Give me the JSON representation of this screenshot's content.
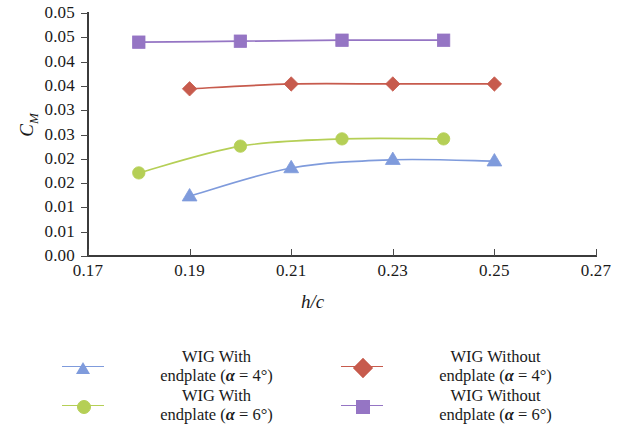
{
  "chart_data": {
    "type": "line",
    "title": "",
    "xlabel": "h/c",
    "ylabel": "C_M",
    "xlim": [
      0.17,
      0.27
    ],
    "ylim": [
      0.0,
      0.05
    ],
    "grid": false,
    "legend_position": "below",
    "x_ticks": [
      {
        "value": 0.17,
        "label": "0.17"
      },
      {
        "value": 0.19,
        "label": "0.19"
      },
      {
        "value": 0.21,
        "label": "0.21"
      },
      {
        "value": 0.23,
        "label": "0.23"
      },
      {
        "value": 0.25,
        "label": "0.25"
      },
      {
        "value": 0.27,
        "label": "0.27"
      }
    ],
    "y_ticks": [
      {
        "value": 0.0,
        "label": "0.00"
      },
      {
        "value": 0.005,
        "label": "0.01"
      },
      {
        "value": 0.01,
        "label": "0.01"
      },
      {
        "value": 0.015,
        "label": "0.02"
      },
      {
        "value": 0.02,
        "label": "0.02"
      },
      {
        "value": 0.025,
        "label": "0.03"
      },
      {
        "value": 0.03,
        "label": "0.03"
      },
      {
        "value": 0.035,
        "label": "0.04"
      },
      {
        "value": 0.04,
        "label": "0.04"
      },
      {
        "value": 0.045,
        "label": "0.05"
      },
      {
        "value": 0.05,
        "label": "0.05"
      }
    ],
    "series": [
      {
        "name": "WIG With endplate (a = 4deg)",
        "marker": "triangle",
        "color": "#7f9bdc",
        "x": [
          0.19,
          0.21,
          0.23,
          0.25
        ],
        "y": [
          0.0123,
          0.0181,
          0.0198,
          0.0195
        ]
      },
      {
        "name": "WIG With endplate (a = 6deg)",
        "marker": "circle",
        "color": "#b5cf56",
        "x": [
          0.18,
          0.2,
          0.22,
          0.24
        ],
        "y": [
          0.0171,
          0.0226,
          0.0241,
          0.0241
        ]
      },
      {
        "name": "WIG Without endplate (a = 4deg)",
        "marker": "diamond",
        "color": "#c75b4d",
        "x": [
          0.19,
          0.21,
          0.23,
          0.25
        ],
        "y": [
          0.0344,
          0.0354,
          0.0354,
          0.0354
        ]
      },
      {
        "name": "WIG Without endplate (a = 6deg)",
        "marker": "square",
        "color": "#9575c4",
        "x": [
          0.18,
          0.2,
          0.22,
          0.24
        ],
        "y": [
          0.044,
          0.0442,
          0.0444,
          0.0444
        ]
      }
    ]
  },
  "axes": {
    "ylabel_main": "C",
    "ylabel_sub": "M",
    "xlabel": "h/c"
  },
  "legend": {
    "entries": [
      {
        "line1": "WIG With",
        "line2_pre": "endplate (",
        "line2_sym": "α",
        "line2_eq": " = 4",
        "line2_post": "°)",
        "marker": "triangle",
        "color": "#7f9bdc"
      },
      {
        "line1": "WIG Without",
        "line2_pre": "endplate (",
        "line2_sym": "α",
        "line2_eq": " = 4",
        "line2_post": "°)",
        "marker": "diamond",
        "color": "#c75b4d"
      },
      {
        "line1": "WIG With",
        "line2_pre": "endplate (",
        "line2_sym": "α",
        "line2_eq": " = 6",
        "line2_post": "°)",
        "marker": "circle",
        "color": "#b5cf56"
      },
      {
        "line1": "WIG Without",
        "line2_pre": "endplate (",
        "line2_sym": "α",
        "line2_eq": " = 6",
        "line2_post": "°)",
        "marker": "square",
        "color": "#9575c4"
      }
    ]
  }
}
